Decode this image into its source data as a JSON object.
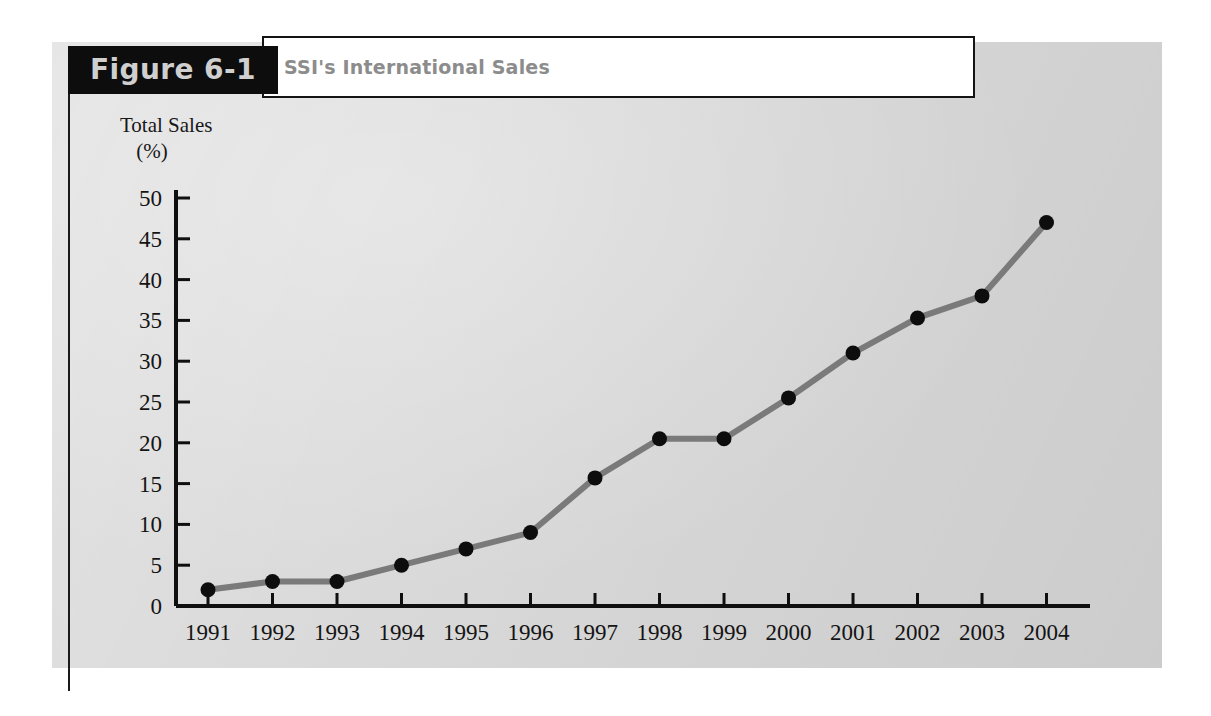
{
  "figure": {
    "label": "Figure 6-1",
    "title": "SSI's International Sales"
  },
  "colors": {
    "panel_background": "#d9d9d9",
    "label_bar": "#0d0d0d",
    "label_text": "#cfcfcf",
    "title_text": "#8c8c8c",
    "axis": "#0f0f0f",
    "line": "#7a7a7a",
    "marker": "#0d0d0d",
    "page_background": "#ffffff"
  },
  "chart_data": {
    "type": "line",
    "title": "SSI's International Sales",
    "subtitle": "",
    "xlabel": "",
    "ylabel": "Total Sales (%)",
    "ylabel_line1": "Total Sales",
    "ylabel_line2": "(%)",
    "categories": [
      "1991",
      "1992",
      "1993",
      "1994",
      "1995",
      "1996",
      "1997",
      "1998",
      "1999",
      "2000",
      "2001",
      "2002",
      "2003",
      "2004"
    ],
    "x": [
      1991,
      1992,
      1993,
      1994,
      1995,
      1996,
      1997,
      1998,
      1999,
      2000,
      2001,
      2002,
      2003,
      2004
    ],
    "values": [
      2.0,
      3.0,
      3.0,
      5.0,
      7.0,
      9.0,
      15.7,
      20.5,
      20.5,
      25.5,
      31.0,
      35.3,
      38.0,
      47.0
    ],
    "series": [
      {
        "name": "Total Sales (%)",
        "values": [
          2.0,
          3.0,
          3.0,
          5.0,
          7.0,
          9.0,
          15.7,
          20.5,
          20.5,
          25.5,
          31.0,
          35.3,
          38.0,
          47.0
        ]
      }
    ],
    "ylim": [
      0,
      52
    ],
    "yticks": [
      0,
      5,
      10,
      15,
      20,
      25,
      30,
      35,
      40,
      45,
      50
    ],
    "ytick_labels": [
      "0",
      "5",
      "10",
      "15",
      "20",
      "25",
      "30",
      "35",
      "40",
      "45",
      "50"
    ],
    "xtick_labels": [
      "1991",
      "1992",
      "1993",
      "1994",
      "1995",
      "1996",
      "1997",
      "1998",
      "1999",
      "2000",
      "2001",
      "2002",
      "2003",
      "2004"
    ],
    "grid": false,
    "legend": false,
    "legend_position": "none",
    "markers": true,
    "annotations": []
  }
}
